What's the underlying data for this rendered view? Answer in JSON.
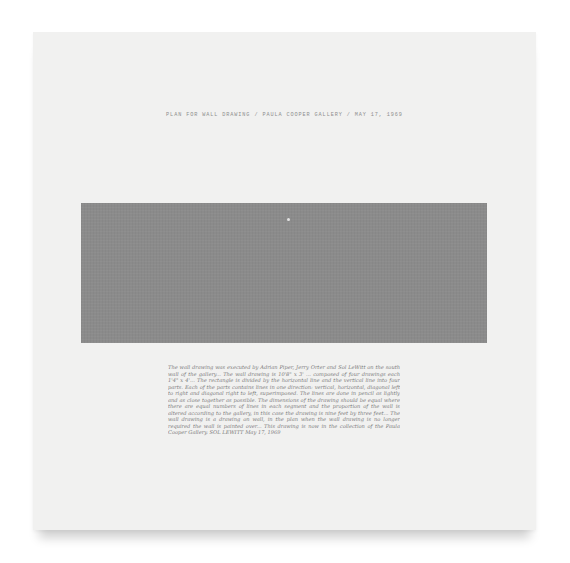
{
  "artwork": {
    "title_line": "PLAN FOR WALL DRAWING / PAULA COOPER GALLERY / MAY 17, 1969",
    "colors": {
      "background": "#ffffff",
      "paper": "#f1f1f0",
      "gray_field": "#8b8b8b",
      "ink": "#7a7a7a"
    },
    "handwritten_notes": "The wall drawing was executed by Adrian Piper, Jerry Orter and Sol LeWitt on the south wall of the gallery... The wall drawing is 10'8\" x 3' ... composed of four drawings each 1'4\" x 4'... The rectangle is divided by the horizontal line and the vertical line into four parts. Each of the parts contains lines in one direction: vertical, horizontal, diagonal left to right and diagonal right to left, superimposed. The lines are done in pencil as lightly and as close together as possible. The dimensions of the drawing should be equal where there are equal numbers of lines in each segment and the proportion of the wall is altered according to the gallery, in this case the drawing is nine feet by three feet... The wall drawing is a drawing on wall, in the plan when the wall drawing is no longer required the wall is painted over... This drawing is now in the collection of the Paula Cooper Gallery. SOL LEWITT May 17, 1969"
  }
}
